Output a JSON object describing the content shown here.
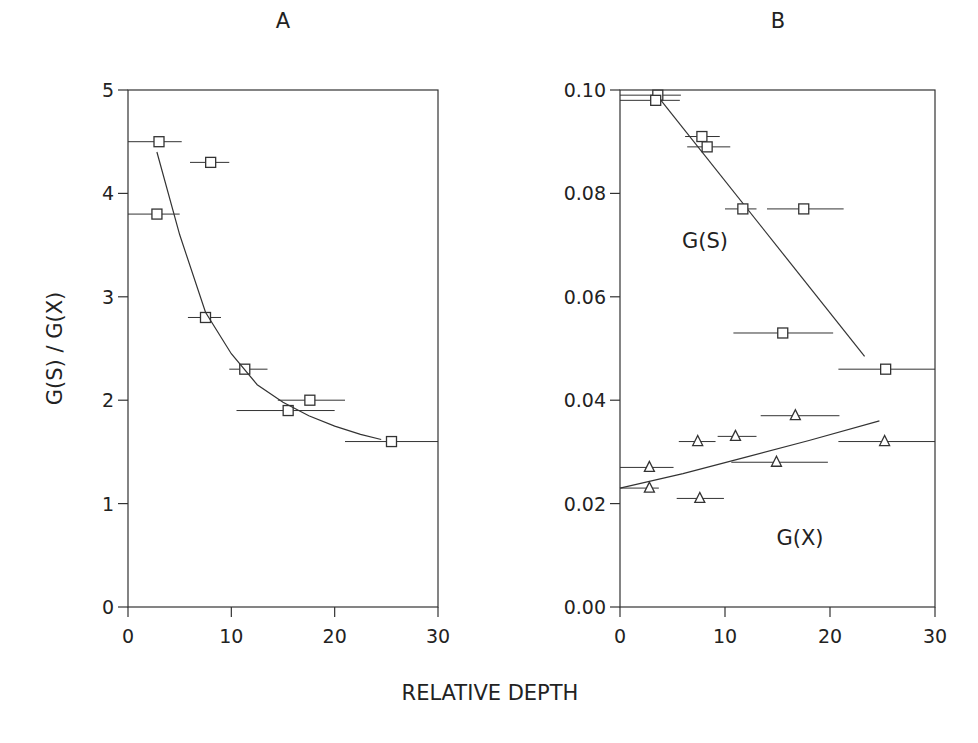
{
  "figure": {
    "xlabel": "RELATIVE DEPTH"
  },
  "chart_data": [
    {
      "type": "scatter",
      "title": "A",
      "xlabel": "RELATIVE DEPTH",
      "ylabel": "G(S) / G(X)",
      "xlim": [
        0,
        30
      ],
      "ylim": [
        0,
        5
      ],
      "xticks": [
        0,
        10,
        20,
        30
      ],
      "yticks": [
        0,
        1,
        2,
        3,
        4,
        5
      ],
      "grid": false,
      "series": [
        {
          "name": "G(S)/G(X)",
          "marker": "square",
          "points": [
            {
              "x": 3.0,
              "y": 4.5,
              "xerr": [
                0,
                5.2
              ]
            },
            {
              "x": 8.0,
              "y": 4.3,
              "xerr": [
                6.0,
                9.8
              ]
            },
            {
              "x": 2.8,
              "y": 3.8,
              "xerr": [
                0,
                5.0
              ]
            },
            {
              "x": 7.5,
              "y": 2.8,
              "xerr": [
                5.8,
                9.0
              ]
            },
            {
              "x": 11.3,
              "y": 2.3,
              "xerr": [
                9.8,
                13.5
              ]
            },
            {
              "x": 17.6,
              "y": 2.0,
              "xerr": [
                14.5,
                21.0
              ]
            },
            {
              "x": 15.5,
              "y": 1.9,
              "xerr": [
                10.5,
                20.0
              ]
            },
            {
              "x": 25.5,
              "y": 1.6,
              "xerr": [
                21.0,
                30.0
              ]
            }
          ]
        },
        {
          "name": "fit",
          "type": "line",
          "x": [
            2.8,
            5,
            7.5,
            10,
            12.5,
            15,
            17.5,
            20,
            22.5,
            24.5
          ],
          "y": [
            4.4,
            3.6,
            2.85,
            2.45,
            2.15,
            1.98,
            1.85,
            1.75,
            1.67,
            1.62
          ]
        }
      ]
    },
    {
      "type": "scatter",
      "title": "B",
      "xlabel": "RELATIVE DEPTH",
      "ylabel": "",
      "xlim": [
        0,
        30
      ],
      "ylim": [
        0.0,
        0.1
      ],
      "xticks": [
        0,
        10,
        20,
        30
      ],
      "yticks": [
        "0.00",
        "0.02",
        "0.04",
        "0.06",
        "0.08",
        "0.10"
      ],
      "grid": false,
      "annotations": [
        "G(S)",
        "G(X)"
      ],
      "series": [
        {
          "name": "G(S)",
          "marker": "square",
          "points": [
            {
              "x": 3.6,
              "y": 0.099,
              "xerr": [
                0,
                5.8
              ]
            },
            {
              "x": 3.4,
              "y": 0.098,
              "xerr": [
                0,
                5.7
              ]
            },
            {
              "x": 7.8,
              "y": 0.091,
              "xerr": [
                6.2,
                9.5
              ]
            },
            {
              "x": 8.3,
              "y": 0.089,
              "xerr": [
                6.4,
                10.5
              ]
            },
            {
              "x": 11.7,
              "y": 0.077,
              "xerr": [
                10.0,
                13.0
              ]
            },
            {
              "x": 17.5,
              "y": 0.077,
              "xerr": [
                14.0,
                21.3
              ]
            },
            {
              "x": 15.5,
              "y": 0.053,
              "xerr": [
                10.8,
                20.3
              ]
            },
            {
              "x": 25.3,
              "y": 0.046,
              "xerr": [
                20.8,
                30.0
              ]
            }
          ],
          "fit": {
            "x": [
              3.5,
              23.3
            ],
            "y": [
              0.099,
              0.0485
            ]
          }
        },
        {
          "name": "G(X)",
          "marker": "triangle",
          "points": [
            {
              "x": 2.8,
              "y": 0.027,
              "xerr": [
                0,
                5.1
              ]
            },
            {
              "x": 2.8,
              "y": 0.023,
              "xerr": [
                0,
                3.7
              ]
            },
            {
              "x": 7.4,
              "y": 0.032,
              "xerr": [
                5.6,
                9.1
              ]
            },
            {
              "x": 7.6,
              "y": 0.021,
              "xerr": [
                5.4,
                9.9
              ]
            },
            {
              "x": 11.0,
              "y": 0.033,
              "xerr": [
                9.3,
                13.0
              ]
            },
            {
              "x": 16.7,
              "y": 0.037,
              "xerr": [
                13.4,
                20.9
              ]
            },
            {
              "x": 14.9,
              "y": 0.028,
              "xerr": [
                10.6,
                19.8
              ]
            },
            {
              "x": 25.2,
              "y": 0.032,
              "xerr": [
                20.8,
                30.0
              ]
            }
          ],
          "fit": {
            "x": [
              0,
              6,
              12,
              18,
              24.7
            ],
            "y": [
              0.023,
              0.0258,
              0.029,
              0.0322,
              0.036
            ]
          }
        }
      ]
    }
  ]
}
